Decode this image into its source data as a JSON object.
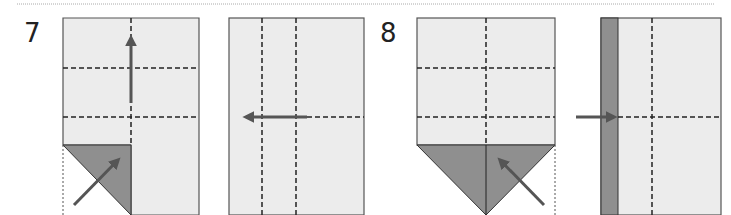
{
  "steps": [
    {
      "number": "7"
    },
    {
      "number": "8"
    }
  ],
  "colors": {
    "paper": "#ececec",
    "paper_back": "#8f8f8f",
    "outline": "#555555",
    "fold_line": "#222222",
    "arrow": "#555555",
    "separator": "#aaaaaa"
  },
  "panels": [
    {
      "id": "step7-before",
      "description": "Fold bottom-left corner up to center, then fold upward"
    },
    {
      "id": "step7-after",
      "description": "Fold left"
    },
    {
      "id": "step8-before",
      "description": "Fold bottom-right corner up"
    },
    {
      "id": "step8-after",
      "description": "Fold strip to the right"
    }
  ]
}
